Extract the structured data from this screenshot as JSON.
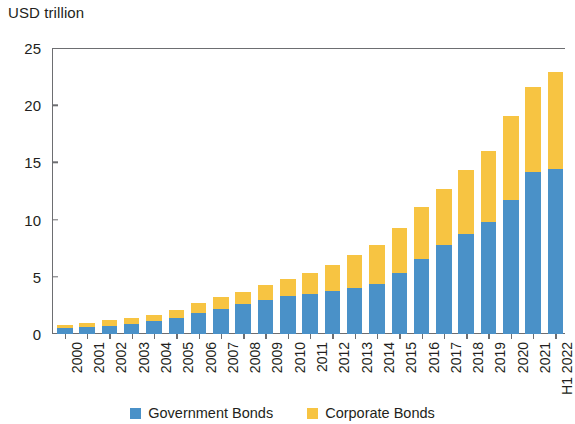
{
  "chart_data": {
    "type": "bar",
    "subtype": "stacked-bar",
    "title": "",
    "ylabel": "USD trillion",
    "xlabel": "",
    "ylim": [
      0,
      25
    ],
    "yticks": [
      0,
      5,
      10,
      15,
      20,
      25
    ],
    "grid": false,
    "legend_position": "bottom-center",
    "x_label_rotation": -90,
    "note": "Right edge of plot is cropped; the final H1 2022 bar is partially cut off.",
    "categories": [
      "2000",
      "2001",
      "2002",
      "2003",
      "2004",
      "2005",
      "2006",
      "2007",
      "2008",
      "2009",
      "2010",
      "2011",
      "2012",
      "2013",
      "2014",
      "2015",
      "2016",
      "2017",
      "2018",
      "2019",
      "2020",
      "2021",
      "H1 2022"
    ],
    "series": [
      {
        "name": "Government Bonds",
        "color": "#4A91C8",
        "values": [
          0.5,
          0.6,
          0.7,
          0.9,
          1.1,
          1.4,
          1.8,
          2.2,
          2.6,
          3.0,
          3.3,
          3.5,
          3.8,
          4.0,
          4.4,
          5.3,
          6.6,
          7.8,
          8.7,
          9.8,
          11.7,
          14.2,
          14.4
        ]
      },
      {
        "name": "Corporate Bonds",
        "color": "#F7C442",
        "values": [
          0.3,
          0.4,
          0.5,
          0.5,
          0.6,
          0.7,
          0.9,
          1.0,
          1.1,
          1.3,
          1.5,
          1.8,
          2.2,
          2.9,
          3.4,
          4.0,
          4.5,
          4.9,
          5.6,
          6.2,
          7.4,
          7.4,
          8.5
        ]
      }
    ],
    "totals": [
      0.8,
      1.0,
      1.2,
      1.4,
      1.7,
      2.1,
      2.7,
      3.2,
      3.7,
      4.3,
      4.8,
      5.3,
      6.0,
      6.9,
      7.8,
      9.3,
      11.1,
      12.7,
      14.3,
      16.0,
      19.1,
      21.6,
      22.9
    ]
  },
  "legend": {
    "items": [
      {
        "label": "Government Bonds",
        "color": "#4A91C8"
      },
      {
        "label": "Corporate Bonds",
        "color": "#F7C442"
      }
    ]
  },
  "colors": {
    "government": "#4A91C8",
    "corporate": "#F7C442",
    "axis": "#6d6e71",
    "text": "#231f20",
    "background": "#ffffff"
  }
}
